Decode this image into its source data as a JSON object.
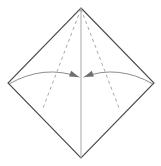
{
  "figure": {
    "title": "Origami fold step diagram",
    "canvas": {
      "width": 161,
      "height": 166,
      "background_color": "#ffffff"
    },
    "colors": {
      "outline": "#4a4a4a",
      "center_crease": "#b0b0b0",
      "fold_line_dashed": "#a8a8a8",
      "arrow": "#8c8c8c",
      "arrowhead_fill": "#6f6f6f",
      "background": "#ffffff"
    },
    "shape": {
      "name": "square-diamond",
      "vertices": {
        "top": {
          "x": 81,
          "y": 8
        },
        "right": {
          "x": 154,
          "y": 83
        },
        "bottom": {
          "x": 81,
          "y": 158
        },
        "left": {
          "x": 8,
          "y": 83
        }
      },
      "stroke_width": 1.1
    },
    "center_crease": {
      "name": "vertical-center-crease",
      "from": {
        "x": 81,
        "y": 8
      },
      "to": {
        "x": 81,
        "y": 158
      },
      "style": "solid",
      "stroke_width": 1.1
    },
    "fold_lines": [
      {
        "name": "left-valley-fold",
        "from": {
          "x": 81,
          "y": 9
        },
        "to": {
          "x": 43,
          "y": 108
        },
        "style": "dashed",
        "dash_pattern": "3.2 3.2",
        "stroke_width": 1
      },
      {
        "name": "right-valley-fold",
        "from": {
          "x": 81,
          "y": 9
        },
        "to": {
          "x": 119,
          "y": 108
        },
        "style": "dashed",
        "dash_pattern": "3.2 3.2",
        "stroke_width": 1
      }
    ],
    "arrows": [
      {
        "name": "left-fold-arrow",
        "direction": "left-corner-to-center",
        "start": {
          "x": 9,
          "y": 84
        },
        "control": {
          "x": 44,
          "y": 64
        },
        "end": {
          "x": 79,
          "y": 77
        },
        "head_angle_deg": 22,
        "stroke_width": 1
      },
      {
        "name": "right-fold-arrow",
        "direction": "right-corner-to-center",
        "start": {
          "x": 153,
          "y": 84
        },
        "control": {
          "x": 118,
          "y": 64
        },
        "end": {
          "x": 84,
          "y": 77
        },
        "head_angle_deg": 158,
        "stroke_width": 1
      }
    ]
  }
}
